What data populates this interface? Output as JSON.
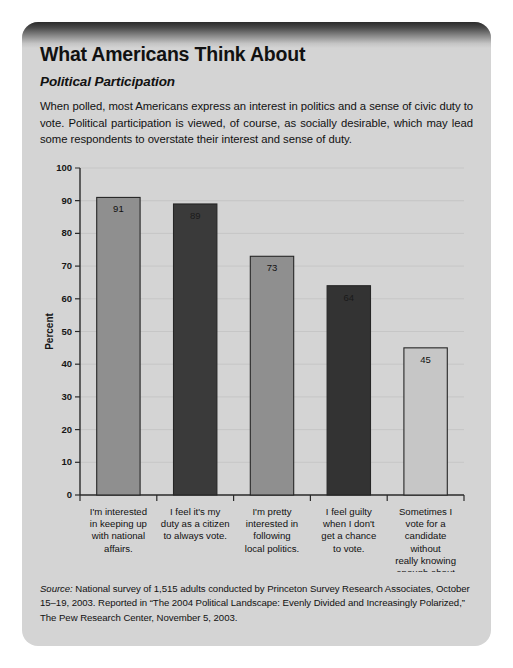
{
  "card": {
    "title": "What Americans Think About",
    "subtitle": "Political Participation",
    "intro": "When polled, most Americans express an interest in politics and a sense of civic duty to vote. Political participation is viewed, of course, as socially desirable, which may lead some respondents to overstate their interest and sense of duty.",
    "source_lead": "Source:",
    "source_text": " National survey of 1,515 adults conducted by Princeton Survey Research Associates, October 15–19, 2003. Reported in “The 2004 Political Landscape: Evenly Divided and Increasingly Polarized,” The Pew Research Center, November 5, 2003."
  },
  "chart_data": {
    "type": "bar",
    "title": "",
    "xlabel": "",
    "ylabel": "Percent",
    "ylim": [
      0,
      100
    ],
    "ytick_step": 10,
    "yticks": [
      0,
      10,
      20,
      30,
      40,
      50,
      60,
      70,
      80,
      90,
      100
    ],
    "grid": true,
    "legend": "none",
    "categories": [
      "I'm interested in keeping up with national affairs.",
      "I feel it's my duty as a citizen to always vote.",
      "I'm pretty interested in following local politics.",
      "I feel guilty when I don't get a chance to vote.",
      "Sometimes I vote for a candidate without really knowing enough about him or her."
    ],
    "category_lines": [
      [
        "I'm interested",
        "in keeping up",
        "with national",
        "affairs."
      ],
      [
        "I feel it's my",
        "duty as a citizen",
        "to always vote."
      ],
      [
        "I'm pretty",
        "interested in",
        "following",
        "local politics."
      ],
      [
        "I feel guilty",
        "when I don't",
        "get a chance",
        "to vote."
      ],
      [
        "Sometimes I",
        "vote for a",
        "candidate",
        "without",
        "really knowing",
        "enough about",
        "him or her."
      ]
    ],
    "values": [
      91,
      89,
      73,
      64,
      45
    ],
    "bar_colors": [
      "#8f8f8f",
      "#3a3a3a",
      "#8f8f8f",
      "#333333",
      "#c6c6c6"
    ]
  },
  "colors": {
    "card_background": "#d4d4d4",
    "bar_gray": "#8f8f8f",
    "bar_dark": "#3a3a3a",
    "bar_light": "#c6c6c6",
    "axis": "#2a2a2a",
    "text": "#111111"
  }
}
